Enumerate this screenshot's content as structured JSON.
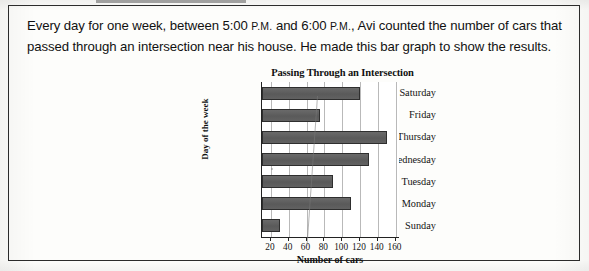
{
  "document": {
    "question_lines": [
      "Every day for one week, between 5:00 P.M. and 6:00 P.M., Avi counted the number",
      "of cars that passed through an intersection near his house.  He made this bar",
      "graph to show the results."
    ],
    "question_text": "Every day for one week, between 5:00 P.M. and 6:00 P.M., Avi counted the number of cars that passed through an intersection near his house.  He made this bar graph to show the results.",
    "segments": {
      "part1": "Every day for one week, between 5:00 ",
      "pm1": "P.M.",
      "part2": " and 6:00 ",
      "pm2": "P.M.",
      "part3": ", Avi counted the number of cars that passed through an intersection near his house.  He made this bar graph to show the results."
    }
  },
  "chart_data": {
    "type": "bar",
    "orientation": "horizontal",
    "title": "Passing Through an Intersection",
    "xlabel": "Number of cars",
    "ylabel": "Day of the week",
    "categories": [
      "Sunday",
      "Monday",
      "Tuesday",
      "Wednesday",
      "Thursday",
      "Friday",
      "Saturday"
    ],
    "values": [
      30,
      110,
      90,
      130,
      150,
      75,
      120
    ],
    "display_order": [
      "Saturday",
      "Friday",
      "Thursday",
      "Wednesday",
      "Tuesday",
      "Monday",
      "Sunday"
    ],
    "display_values": [
      120,
      75,
      150,
      130,
      90,
      110,
      30
    ],
    "xticks": [
      20,
      40,
      60,
      80,
      100,
      120,
      140,
      160
    ],
    "xtick_labels": [
      "20",
      "40",
      "60",
      "80",
      "100",
      "120",
      "140",
      "160"
    ],
    "xlim": [
      10,
      165
    ],
    "grid": true,
    "legend": false,
    "bar_color": "#5f5f5f",
    "bar_edge_color": "#2e2e2e"
  }
}
